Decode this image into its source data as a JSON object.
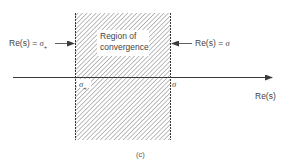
{
  "figure": {
    "caption": "(c)",
    "region_label_line1": "Region of",
    "region_label_line2": "convergence",
    "left_boundary": {
      "prefix": "Re(s) = ",
      "symbol": "σ",
      "subscript": "+"
    },
    "right_boundary": {
      "prefix": "Re(s) = ",
      "symbol": "σ"
    },
    "axis_label": "Re(s)",
    "tick_left": {
      "symbol": "σ",
      "subscript": "+"
    },
    "tick_right": {
      "symbol": "σ"
    }
  },
  "colors": {
    "line": "#3a3a3a",
    "hatch": "#6a6a6a",
    "background": "#ffffff"
  }
}
